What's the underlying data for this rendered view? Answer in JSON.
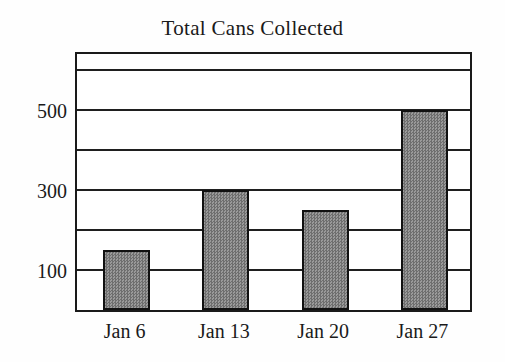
{
  "chart_data": {
    "type": "bar",
    "title": "Total Cans Collected",
    "xlabel": "",
    "ylabel": "",
    "categories": [
      "Jan 6",
      "Jan 13",
      "Jan 20",
      "Jan 27"
    ],
    "values": [
      150,
      300,
      250,
      500
    ],
    "ylim": [
      0,
      650
    ],
    "y_ticks": [
      100,
      300,
      500
    ],
    "y_tick_labels": [
      "100",
      "300",
      "500"
    ],
    "gridlines": [
      100,
      200,
      300,
      400,
      500,
      600
    ],
    "grid": true,
    "legend": null,
    "legend_position": "none",
    "bar_fill_color": "#838383",
    "bar_border_color": "#111111",
    "axis_color": "#1a1a1a",
    "background_color": "#ffffff"
  },
  "axes": {
    "y_labels": [
      {
        "text": "500",
        "value": 500
      },
      {
        "text": "300",
        "value": 300
      },
      {
        "text": "100",
        "value": 100
      }
    ],
    "x_labels": [
      {
        "text": "Jan 6"
      },
      {
        "text": "Jan 13"
      },
      {
        "text": "Jan 20"
      },
      {
        "text": "Jan 27"
      }
    ]
  }
}
